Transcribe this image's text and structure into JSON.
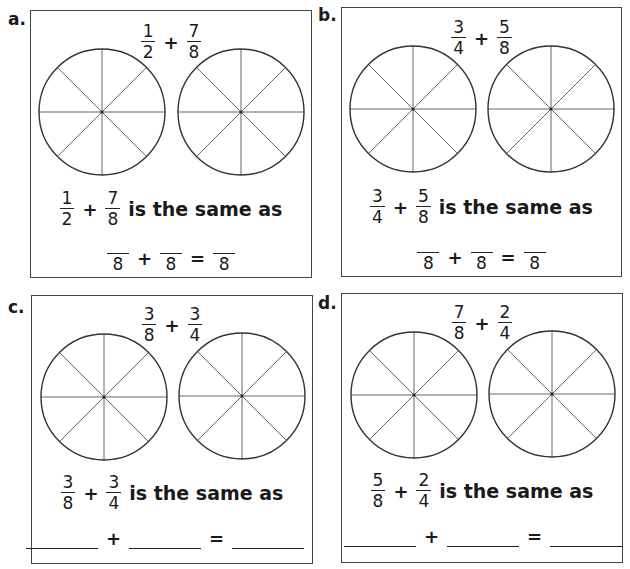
{
  "panels": [
    {
      "label": "a.",
      "top": {
        "a_num": "1",
        "a_den": "2",
        "op": "+",
        "b_num": "7",
        "b_den": "8"
      },
      "same": {
        "a_num": "1",
        "a_den": "2",
        "op": "+",
        "b_num": "7",
        "b_den": "8",
        "text": "is the same as"
      },
      "answer": {
        "type": "eighths",
        "den1": "8",
        "op1": "+",
        "den2": "8",
        "op2": "=",
        "den3": "8"
      }
    },
    {
      "label": "b.",
      "top": {
        "a_num": "3",
        "a_den": "4",
        "op": "+",
        "b_num": "5",
        "b_den": "8"
      },
      "same": {
        "a_num": "3",
        "a_den": "4",
        "op": "+",
        "b_num": "5",
        "b_den": "8",
        "text": "is the same as"
      },
      "answer": {
        "type": "eighths",
        "den1": "8",
        "op1": "+",
        "den2": "8",
        "op2": "=",
        "den3": "8"
      }
    },
    {
      "label": "c.",
      "top": {
        "a_num": "3",
        "a_den": "8",
        "op": "+",
        "b_num": "3",
        "b_den": "4"
      },
      "same": {
        "a_num": "3",
        "a_den": "8",
        "op": "+",
        "b_num": "3",
        "b_den": "4",
        "text": "is the same as"
      },
      "answer": {
        "type": "blanks",
        "op1": "+",
        "op2": "="
      }
    },
    {
      "label": "d.",
      "top": {
        "a_num": "7",
        "a_den": "8",
        "op": "+",
        "b_num": "2",
        "b_den": "4"
      },
      "same": {
        "a_num": "5",
        "a_den": "8",
        "op": "+",
        "b_num": "2",
        "b_den": "4",
        "text": "is the same as"
      },
      "answer": {
        "type": "blanks",
        "op1": "+",
        "op2": "="
      }
    }
  ],
  "circle": {
    "segments": 8,
    "stroke": "#333333",
    "spoke": "#555555"
  }
}
